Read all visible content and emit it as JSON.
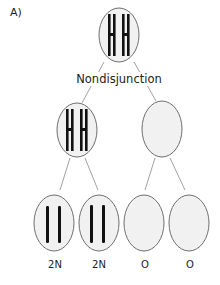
{
  "figure": {
    "panel_label": "A)",
    "event_label": "Nondisjunction",
    "colors": {
      "cell_fill": "#f1f1f1",
      "cell_stroke": "#7a7a7a",
      "chromosome": "#111111",
      "line": "#8a8a8a"
    },
    "levels": [
      {
        "name": "parent",
        "cells": [
          {
            "chromosomes": "XX (2 duplicated pairs)"
          }
        ]
      },
      {
        "name": "meiosis-I",
        "cells": [
          {
            "chromosomes": "XX (2 duplicated pairs)"
          },
          {
            "chromosomes": "none"
          }
        ]
      },
      {
        "name": "meiosis-II",
        "cells": [
          {
            "chromosomes": "2 single",
            "label": "2N"
          },
          {
            "chromosomes": "2 single",
            "label": "2N"
          },
          {
            "chromosomes": "none",
            "label": "O"
          },
          {
            "chromosomes": "none",
            "label": "O"
          }
        ]
      }
    ],
    "gamete_labels": [
      "2N",
      "2N",
      "O",
      "O"
    ]
  }
}
